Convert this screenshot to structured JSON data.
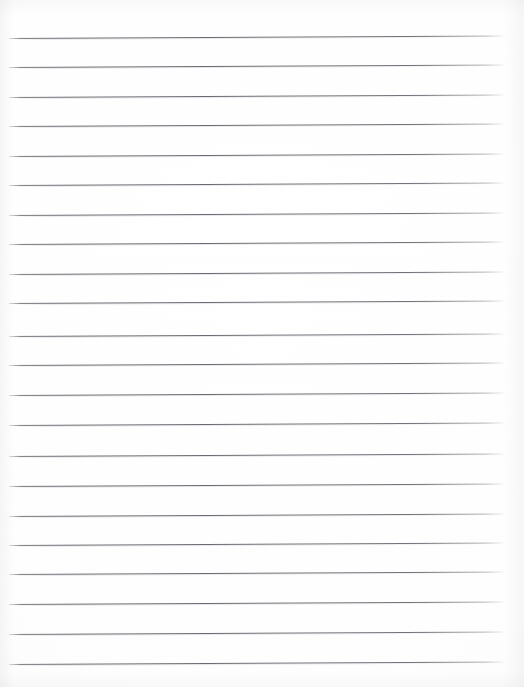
{
  "document": {
    "kind": "scanned-lined-paper",
    "title": "Blank lined notebook page",
    "content_text": "",
    "page_width": 524,
    "page_height": 687,
    "paper_color": "#fefefe",
    "rule_color": "#6c6c74",
    "rule_count": 22,
    "first_rule_y": 38,
    "rule_spacing": 29.5,
    "rule_left_x": 9,
    "rule_right_x": 504,
    "rule_thickness": 1,
    "rule_tilt_deg": -0.28,
    "has_margin_line": false,
    "has_handwriting": false,
    "rules": [
      {
        "index": 1,
        "y": 38,
        "left": 9,
        "width": 495
      },
      {
        "index": 2,
        "y": 67,
        "left": 9,
        "width": 495
      },
      {
        "index": 3,
        "y": 97,
        "left": 9,
        "width": 495
      },
      {
        "index": 4,
        "y": 126,
        "left": 9,
        "width": 495
      },
      {
        "index": 5,
        "y": 156,
        "left": 9,
        "width": 495
      },
      {
        "index": 6,
        "y": 185,
        "left": 9,
        "width": 495
      },
      {
        "index": 7,
        "y": 215,
        "left": 9,
        "width": 495
      },
      {
        "index": 8,
        "y": 244,
        "left": 9,
        "width": 495
      },
      {
        "index": 9,
        "y": 274,
        "left": 9,
        "width": 495
      },
      {
        "index": 10,
        "y": 303,
        "left": 9,
        "width": 495
      },
      {
        "index": 11,
        "y": 336,
        "left": 9,
        "width": 495
      },
      {
        "index": 12,
        "y": 365,
        "left": 9,
        "width": 495
      },
      {
        "index": 13,
        "y": 395,
        "left": 9,
        "width": 495
      },
      {
        "index": 14,
        "y": 425,
        "left": 9,
        "width": 495
      },
      {
        "index": 15,
        "y": 456,
        "left": 9,
        "width": 495
      },
      {
        "index": 16,
        "y": 486,
        "left": 9,
        "width": 495
      },
      {
        "index": 17,
        "y": 516,
        "left": 9,
        "width": 495
      },
      {
        "index": 18,
        "y": 545,
        "left": 9,
        "width": 495
      },
      {
        "index": 19,
        "y": 574,
        "left": 9,
        "width": 495
      },
      {
        "index": 20,
        "y": 604,
        "left": 9,
        "width": 495
      },
      {
        "index": 21,
        "y": 634,
        "left": 9,
        "width": 495
      },
      {
        "index": 22,
        "y": 664,
        "left": 9,
        "width": 495
      }
    ]
  }
}
